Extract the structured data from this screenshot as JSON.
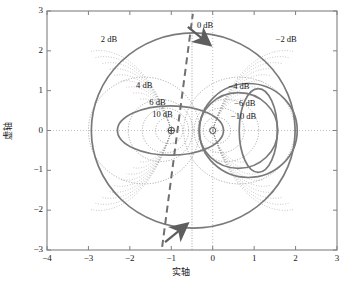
{
  "figure": {
    "kind": "nyquist-plot-with-m-circles",
    "background": "#ffffff",
    "frame_color": "#808080",
    "grid_color": "#b4b4b4",
    "nyquist_color": "#7a7a7a",
    "mcircle_color": "#9a9a9a",
    "dashed_color": "#707070",
    "axes": {
      "x_title": "实轴",
      "y_title": "虚轴",
      "xlim": [
        -4,
        3
      ],
      "ylim": [
        -3,
        3
      ],
      "xticks": [
        "-4",
        "-3",
        "-2",
        "-1",
        "0",
        "1",
        "2",
        "3"
      ],
      "yticks": [
        "3",
        "2",
        "1",
        "0",
        "-1",
        "-2",
        "-3"
      ],
      "xtick_values": [
        -4,
        -3,
        -2,
        -1,
        0,
        1,
        2,
        3
      ],
      "ytick_values": [
        3,
        2,
        1,
        0,
        -1,
        -2,
        -3
      ],
      "grid": "dotted crosshair at x=0 and y=0"
    },
    "markers": {
      "critical_point_label": "⊕",
      "critical_point": [
        -1,
        0
      ],
      "origin_point": [
        0,
        0
      ]
    },
    "contour_labels": [
      {
        "text": "0 dB",
        "value": 0,
        "x": -0.38,
        "y": 2.63
      },
      {
        "text": "2 dB",
        "value": 2,
        "x": -2.7,
        "y": 2.28
      },
      {
        "text": "−2 dB",
        "value": -2,
        "x": 1.52,
        "y": 2.28
      },
      {
        "text": "4 dB",
        "value": 4,
        "x": -1.85,
        "y": 1.12
      },
      {
        "text": "−4 dB",
        "value": -4,
        "x": 0.38,
        "y": 1.1
      },
      {
        "text": "6 dB",
        "value": 6,
        "x": -1.53,
        "y": 0.7
      },
      {
        "text": "−6 dB",
        "value": -6,
        "x": 0.52,
        "y": 0.66
      },
      {
        "text": "10 dB",
        "value": 10,
        "x": -1.46,
        "y": 0.38
      },
      {
        "text": "−10 dB",
        "value": -10,
        "x": 0.44,
        "y": 0.34
      }
    ]
  },
  "chart_data": {
    "type": "line",
    "title": "",
    "xlabel": "实轴",
    "ylabel": "虚轴",
    "xlim": [
      -4,
      3
    ],
    "ylim": [
      -3,
      3
    ],
    "grid": true,
    "legend": "none",
    "annotations": [
      "0 dB",
      "2 dB",
      "−2 dB",
      "4 dB",
      "−4 dB",
      "6 dB",
      "−6 dB",
      "10 dB",
      "−10 dB"
    ],
    "series": [
      {
        "name": "nyquist-locus-outer",
        "style": "solid",
        "color": "#7a7a7a",
        "description": "large closed Nyquist contour centered near (-0.5,0) radius ≈ 2.45",
        "shape": "ellipse",
        "cx": -0.47,
        "cy": 0.0,
        "rx": 2.46,
        "ry": 2.45
      },
      {
        "name": "nyquist-locus-lobe-left",
        "style": "solid",
        "color": "#7a7a7a",
        "description": "left lobe ellipse centered near (-1.0,0)",
        "shape": "ellipse",
        "cx": -1.02,
        "cy": 0.0,
        "rx": 1.28,
        "ry": 0.62
      },
      {
        "name": "nyquist-locus-lobe-right",
        "style": "solid",
        "color": "#7a7a7a",
        "description": "right lobe circle centered near (0.62,0)",
        "shape": "ellipse",
        "cx": 0.62,
        "cy": 0.0,
        "rx": 0.95,
        "ry": 0.95
      },
      {
        "name": "nyquist-locus-lobe-right-2",
        "style": "solid",
        "color": "#7a7a7a",
        "description": "secondary right circle centered near (0.85,0)",
        "shape": "ellipse",
        "cx": 0.86,
        "cy": 0.0,
        "rx": 1.18,
        "ry": 1.18
      },
      {
        "name": "nyquist-locus-lobe-right-3",
        "style": "solid",
        "color": "#7a7a7a",
        "description": "narrow right lobe near (1.1,0)",
        "shape": "ellipse",
        "cx": 1.1,
        "cy": 0.0,
        "rx": 0.46,
        "ry": 1.05
      },
      {
        "name": "asymptote",
        "style": "dashed",
        "color": "#707070",
        "description": "dashed line with arrowheads through origin region, from (-1.2,-2.9) to (-0.55,2.9)",
        "x1": -1.22,
        "y1": -2.92,
        "x2": -0.48,
        "y2": 2.93
      }
    ],
    "m_circles": [
      {
        "db": 0,
        "type": "line",
        "x": -0.5
      },
      {
        "db": 2,
        "type": "circle",
        "cx": -1.66,
        "cy": 0,
        "r": 1.34
      },
      {
        "db": -2,
        "type": "circle",
        "cx": 0.64,
        "cy": 0,
        "r": 1.34
      },
      {
        "db": 4,
        "type": "circle",
        "cx": -1.26,
        "cy": 0,
        "r": 0.78
      },
      {
        "db": -4,
        "type": "circle",
        "cx": 0.33,
        "cy": 0,
        "r": 0.78
      },
      {
        "db": 6,
        "type": "circle",
        "cx": -1.14,
        "cy": 0,
        "r": 0.56
      },
      {
        "db": -6,
        "type": "circle",
        "cx": 0.2,
        "cy": 0,
        "r": 0.56
      },
      {
        "db": 10,
        "type": "circle",
        "cx": -1.05,
        "cy": 0,
        "r": 0.33
      },
      {
        "db": -10,
        "type": "circle",
        "cx": 0.1,
        "cy": 0,
        "r": 0.33
      },
      {
        "db": 20,
        "type": "circle",
        "cx": -1.01,
        "cy": 0,
        "r": 0.1
      },
      {
        "db": -20,
        "type": "circle",
        "cx": 0.01,
        "cy": 0,
        "r": 0.1
      }
    ]
  }
}
